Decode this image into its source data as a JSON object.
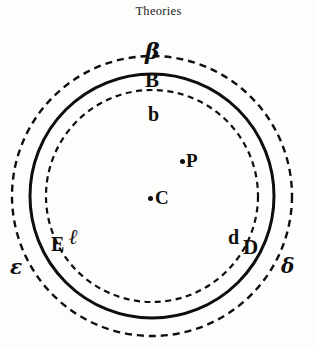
{
  "figure": {
    "title": "Theories",
    "background_color": "#fdfdfc",
    "ink_color": "#100e0c"
  },
  "geometry": {
    "center_x": 152,
    "center_y": 196,
    "outer_dashed_radius": 140,
    "solid_radius": 122,
    "inner_dashed_radius": 106
  },
  "rings": [
    {
      "name": "outer-dashed-circle",
      "style": "dashed",
      "radius": 140,
      "stroke_width": 2.4,
      "color": "#100e0c"
    },
    {
      "name": "middle-solid-circle",
      "style": "solid",
      "radius": 122,
      "stroke_width": 3.0,
      "color": "#100e0c"
    },
    {
      "name": "inner-dashed-circle",
      "style": "dashed",
      "radius": 106,
      "stroke_width": 2.2,
      "color": "#100e0c"
    }
  ],
  "labels": {
    "beta": "β",
    "B_upper": "B",
    "b_lower": "b",
    "P": "P",
    "C": "C",
    "E_upper": "E",
    "ell": "ℓ",
    "epsilon": "ε",
    "d_lower": "d",
    "D_upper": "D",
    "delta": "δ"
  },
  "points": [
    {
      "name": "point-P",
      "label": "P",
      "x": 186,
      "y": 163
    },
    {
      "name": "point-C",
      "label": "C",
      "x": 155,
      "y": 199
    }
  ],
  "ring_labels": [
    {
      "name": "label-beta",
      "text": "β",
      "ring": "outer-dashed-circle",
      "position": "top"
    },
    {
      "name": "label-B-upper",
      "text": "B",
      "ring": "middle-solid-circle",
      "position": "top"
    },
    {
      "name": "label-b-lower",
      "text": "b",
      "ring": "inner-dashed-circle",
      "position": "top"
    },
    {
      "name": "label-epsilon",
      "text": "ε",
      "ring": "outer-dashed-circle",
      "position": "lower-left"
    },
    {
      "name": "label-E-upper",
      "text": "E",
      "ring": "middle-solid-circle",
      "position": "lower-left"
    },
    {
      "name": "label-ell",
      "text": "ℓ",
      "ring": "inner-dashed-circle",
      "position": "lower-left"
    },
    {
      "name": "label-delta",
      "text": "δ",
      "ring": "outer-dashed-circle",
      "position": "lower-right"
    },
    {
      "name": "label-D-upper",
      "text": "D",
      "ring": "middle-solid-circle",
      "position": "lower-right"
    },
    {
      "name": "label-d-lower",
      "text": "d",
      "ring": "inner-dashed-circle",
      "position": "lower-right"
    }
  ]
}
